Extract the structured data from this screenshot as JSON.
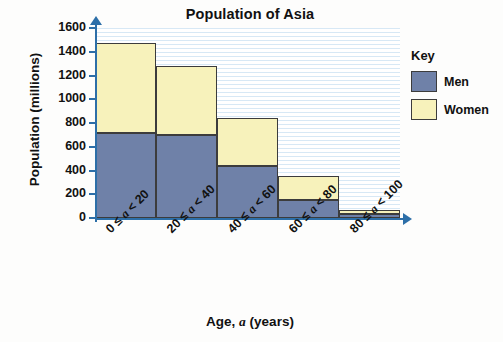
{
  "chart_data": {
    "type": "bar",
    "stacked": true,
    "title": "Population of Asia",
    "xlabel": "Age, a (years)",
    "ylabel": "Population (millions)",
    "categories": [
      "0 ≤ a < 20",
      "20 ≤ a < 40",
      "40 ≤ a < 60",
      "60 ≤ a < 80",
      "80 ≤ a < 100"
    ],
    "series": [
      {
        "name": "Men",
        "color": "#6f81a8",
        "values": [
          720,
          700,
          440,
          150,
          30
        ]
      },
      {
        "name": "Women",
        "color": "#f7f2bb",
        "values": [
          750,
          580,
          400,
          200,
          40
        ]
      }
    ],
    "totals": [
      1470,
      1280,
      840,
      350,
      70
    ],
    "ylim": [
      0,
      1600
    ],
    "yticks": [
      0,
      200,
      400,
      600,
      800,
      1000,
      1200,
      1400,
      1600
    ],
    "ytick_labels": [
      "0",
      "200",
      "400",
      "600",
      "800",
      "1000",
      "1200",
      "1400",
      "1600"
    ],
    "grid": true,
    "legend": {
      "title": "Key",
      "position": "right",
      "entries": [
        {
          "label": "Men",
          "color": "#6f81a8"
        },
        {
          "label": "Women",
          "color": "#f7f2bb"
        }
      ]
    },
    "axis_color": "#2d6fa8",
    "grid_color": "#cfe4f2"
  },
  "category_parts": [
    {
      "low": "0 ≤ ",
      "var": "a",
      "high": " < 20"
    },
    {
      "low": "20 ≤ ",
      "var": "a",
      "high": " < 40"
    },
    {
      "low": "40 ≤ ",
      "var": "a",
      "high": " < 60"
    },
    {
      "low": "60 ≤ ",
      "var": "a",
      "high": " < 80"
    },
    {
      "low": "80 ≤ ",
      "var": "a",
      "high": " < 100"
    }
  ],
  "xlabel_parts": {
    "pre": "Age, ",
    "var": "a",
    "post": " (years)"
  }
}
